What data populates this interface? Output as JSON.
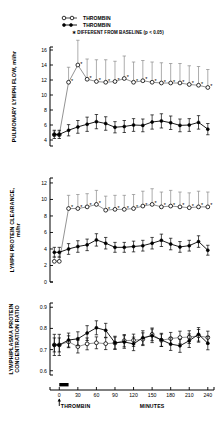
{
  "figure": {
    "legend": [
      {
        "marker": "open-circle",
        "label": "THROMBIN"
      },
      {
        "marker": "filled-circle",
        "label": "THROMBIN"
      },
      {
        "marker": "asterisk",
        "label": "DIFFERENT FROM BASELINE (p < 0.05)"
      }
    ],
    "x_axis": {
      "label": "MINUTES",
      "ticks": [
        0,
        30,
        60,
        90,
        120,
        150,
        180,
        210,
        240
      ],
      "range": [
        -15,
        250
      ],
      "annotation": "THROMBIN",
      "infusion_bar": {
        "start": 0,
        "end": 15
      }
    }
  },
  "chart_data": [
    {
      "type": "line",
      "title": "",
      "panel": "top",
      "xlabel": "MINUTES",
      "ylabel": "PULMONARY LYMPH FLOW, ml/hr",
      "ylim": [
        3.2,
        16.4
      ],
      "yticks": [
        4,
        6,
        8,
        10,
        12,
        14,
        16
      ],
      "xlim": [
        -15,
        250
      ],
      "xticks": [
        0,
        30,
        60,
        90,
        120,
        150,
        180,
        210,
        240
      ],
      "grid": false,
      "legend_position": "top-right",
      "x": [
        -8,
        0,
        15,
        30,
        45,
        60,
        75,
        90,
        105,
        120,
        135,
        150,
        165,
        180,
        195,
        210,
        225,
        240
      ],
      "series": [
        {
          "name": "THROMBIN",
          "marker": "open-circle",
          "values": [
            4.7,
            4.7,
            11.7,
            14.0,
            12.1,
            11.8,
            11.7,
            11.8,
            12.2,
            11.7,
            11.9,
            11.7,
            11.6,
            11.6,
            11.6,
            11.4,
            11.3,
            11.0
          ],
          "errors": [
            0.5,
            0.5,
            2.0,
            3.3,
            2.7,
            2.9,
            3.0,
            2.7,
            3.0,
            2.7,
            2.7,
            2.7,
            2.7,
            2.6,
            2.6,
            2.5,
            2.5,
            2.4
          ],
          "significant": [
            false,
            false,
            true,
            true,
            true,
            true,
            true,
            true,
            true,
            true,
            true,
            true,
            true,
            true,
            true,
            true,
            true,
            true
          ]
        },
        {
          "name": "THROMBIN",
          "marker": "filled-circle",
          "values": [
            4.75,
            4.75,
            5.3,
            5.75,
            6.1,
            6.45,
            6.2,
            5.7,
            5.8,
            6.0,
            5.95,
            6.4,
            6.55,
            6.3,
            5.95,
            6.0,
            6.35,
            5.45
          ],
          "errors": [
            0.55,
            0.55,
            0.75,
            0.85,
            0.95,
            0.95,
            0.9,
            0.75,
            0.8,
            0.85,
            0.85,
            0.95,
            0.95,
            0.9,
            0.85,
            0.85,
            0.9,
            0.75
          ],
          "significant": [
            false,
            false,
            false,
            false,
            false,
            false,
            false,
            false,
            false,
            false,
            false,
            false,
            false,
            false,
            false,
            false,
            false,
            false
          ]
        }
      ]
    },
    {
      "type": "line",
      "title": "",
      "panel": "middle",
      "xlabel": "MINUTES",
      "ylabel": "LYMPH PROTEIN CLEARANCE, ml/hr",
      "ylim": [
        0,
        12.6
      ],
      "yticks": [
        0,
        2,
        4,
        6,
        8,
        10,
        12
      ],
      "xlim": [
        -15,
        250
      ],
      "xticks": [
        0,
        30,
        60,
        90,
        120,
        150,
        180,
        210,
        240
      ],
      "grid": false,
      "x": [
        -8,
        0,
        15,
        30,
        45,
        60,
        75,
        90,
        105,
        120,
        135,
        150,
        165,
        180,
        195,
        210,
        225,
        240
      ],
      "series": [
        {
          "name": "THROMBIN",
          "marker": "open-circle",
          "values": [
            2.5,
            2.5,
            8.9,
            8.9,
            9.1,
            9.4,
            8.7,
            8.8,
            8.8,
            8.9,
            9.2,
            9.4,
            9.1,
            9.2,
            9.1,
            9.0,
            9.1,
            9.1
          ],
          "errors": [
            0.6,
            0.6,
            1.6,
            1.7,
            1.6,
            1.7,
            1.7,
            1.7,
            1.7,
            1.7,
            1.8,
            1.9,
            1.8,
            1.9,
            1.8,
            1.8,
            1.9,
            1.8
          ],
          "significant": [
            false,
            false,
            true,
            true,
            true,
            true,
            true,
            true,
            true,
            true,
            true,
            true,
            true,
            true,
            true,
            true,
            true,
            true
          ]
        },
        {
          "name": "THROMBIN",
          "marker": "filled-circle",
          "values": [
            3.6,
            3.6,
            4.0,
            4.3,
            4.5,
            5.1,
            4.7,
            4.2,
            4.2,
            4.3,
            4.4,
            4.7,
            5.05,
            4.6,
            4.25,
            4.4,
            4.9,
            3.85
          ],
          "errors": [
            0.6,
            0.6,
            0.65,
            0.7,
            0.7,
            0.75,
            0.7,
            0.6,
            0.6,
            0.65,
            0.65,
            0.7,
            0.75,
            0.7,
            0.65,
            0.65,
            0.7,
            0.6
          ],
          "significant": [
            false,
            false,
            false,
            false,
            false,
            false,
            false,
            false,
            false,
            false,
            false,
            false,
            false,
            false,
            false,
            false,
            false,
            false
          ]
        }
      ]
    },
    {
      "type": "line",
      "title": "",
      "panel": "bottom",
      "xlabel": "MINUTES",
      "ylabel": "LYMPH/PLASMA PROTEIN CONCENTRATION RATIO",
      "ylim": [
        0.58,
        0.92
      ],
      "yticks": [
        0.6,
        0.7,
        0.8,
        0.9
      ],
      "ytick_labels": [
        "0.6",
        "0.7",
        "0.8",
        "0.9"
      ],
      "xlim": [
        -15,
        250
      ],
      "xticks": [
        0,
        30,
        60,
        90,
        120,
        150,
        180,
        210,
        240
      ],
      "grid": false,
      "x": [
        -8,
        0,
        15,
        30,
        45,
        60,
        75,
        90,
        105,
        120,
        135,
        150,
        165,
        180,
        195,
        210,
        225,
        240
      ],
      "series": [
        {
          "name": "THROMBIN",
          "marker": "open-circle",
          "values": [
            0.722,
            0.722,
            0.737,
            0.714,
            0.727,
            0.732,
            0.728,
            0.731,
            0.742,
            0.744,
            0.749,
            0.772,
            0.744,
            0.752,
            0.757,
            0.759,
            0.765,
            0.757
          ],
          "errors": [
            0.033,
            0.033,
            0.028,
            0.03,
            0.028,
            0.028,
            0.028,
            0.028,
            0.029,
            0.029,
            0.03,
            0.03,
            0.029,
            0.029,
            0.03,
            0.03,
            0.03,
            0.03
          ],
          "significant": [
            false,
            false,
            false,
            false,
            false,
            false,
            false,
            false,
            false,
            false,
            false,
            false,
            false,
            false,
            false,
            false,
            false,
            false
          ]
        },
        {
          "name": "THROMBIN",
          "marker": "filled-circle",
          "values": [
            0.722,
            0.722,
            0.745,
            0.751,
            0.778,
            0.803,
            0.791,
            0.732,
            0.736,
            0.727,
            0.756,
            0.765,
            0.746,
            0.726,
            0.718,
            0.742,
            0.772,
            0.73
          ],
          "errors": [
            0.05,
            0.05,
            0.033,
            0.033,
            0.035,
            0.033,
            0.033,
            0.031,
            0.03,
            0.032,
            0.033,
            0.032,
            0.031,
            0.03,
            0.031,
            0.032,
            0.032,
            0.031
          ],
          "significant": [
            false,
            false,
            false,
            false,
            false,
            false,
            false,
            false,
            false,
            false,
            false,
            false,
            false,
            false,
            false,
            false,
            false,
            false
          ]
        }
      ]
    }
  ]
}
